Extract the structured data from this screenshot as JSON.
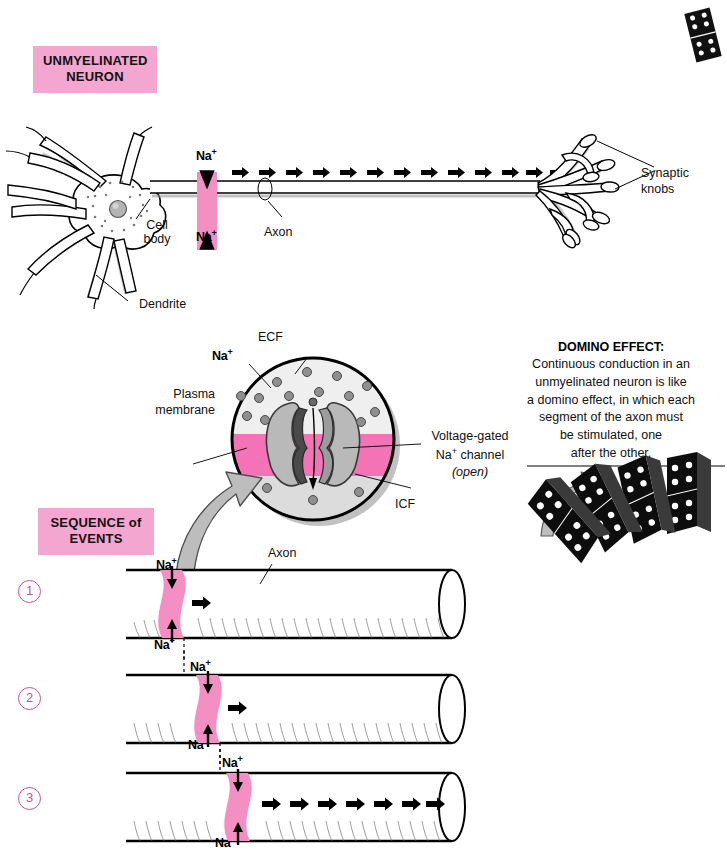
{
  "figure": {
    "title_banner": "UNMYELINATED\nNEURON",
    "sequence_banner": "SEQUENCE of\nEVENTS"
  },
  "colors": {
    "pink_banner": "#f3a6cf",
    "pink_channel": "#f48fc4",
    "membrane_pink": "#f472b6",
    "ecf_fill": "#efefef",
    "icf_fill": "#dcdcdc",
    "step_number": "#c0559a",
    "ink": "#000000",
    "shadow_gray": "#9a9a9a"
  },
  "neuron": {
    "labels": {
      "cell_body": "Cell\nbody",
      "dendrite": "Dendrite",
      "axon": "Axon",
      "synaptic_knobs": "Synaptic\nknobs",
      "na_top": "Na",
      "na_bottom": "Na",
      "na_sup": "+"
    },
    "impulse_arrow_count": 15
  },
  "membrane_detail": {
    "labels": {
      "ecf": "ECF",
      "icf": "ICF",
      "na_outside": "Na",
      "na_sup": "+",
      "plasma_membrane": "Plasma\nmembrane",
      "channel_line1": "Voltage-gated",
      "channel_line2": "Na",
      "channel_line2_sup": "+",
      "channel_line2_rest": " channel",
      "channel_line3": "(open)"
    },
    "ecf_ion_count": 13,
    "icf_ion_count": 3
  },
  "domino": {
    "heading": "DOMINO EFFECT:",
    "body": [
      "Continuous conduction in an",
      "unmyelinated neuron is like",
      "a domino effect, in which each",
      "segment of the axon must",
      "be stimulated, one",
      "after the other."
    ],
    "tile_count": 4
  },
  "sequence": {
    "axon_label": "Axon",
    "steps": [
      {
        "number": "1",
        "band_x": 0.12,
        "arrow_count": 1,
        "na_in": "Na",
        "na_out": "Na",
        "na_sup": "+"
      },
      {
        "number": "2",
        "band_x": 0.3,
        "arrow_count": 1,
        "na_in": "Na",
        "na_out": "Na",
        "na_sup": "+"
      },
      {
        "number": "3",
        "band_x": 0.46,
        "arrow_count": 12,
        "na_in": "Na",
        "na_out": "Na",
        "na_sup": "+"
      }
    ]
  }
}
